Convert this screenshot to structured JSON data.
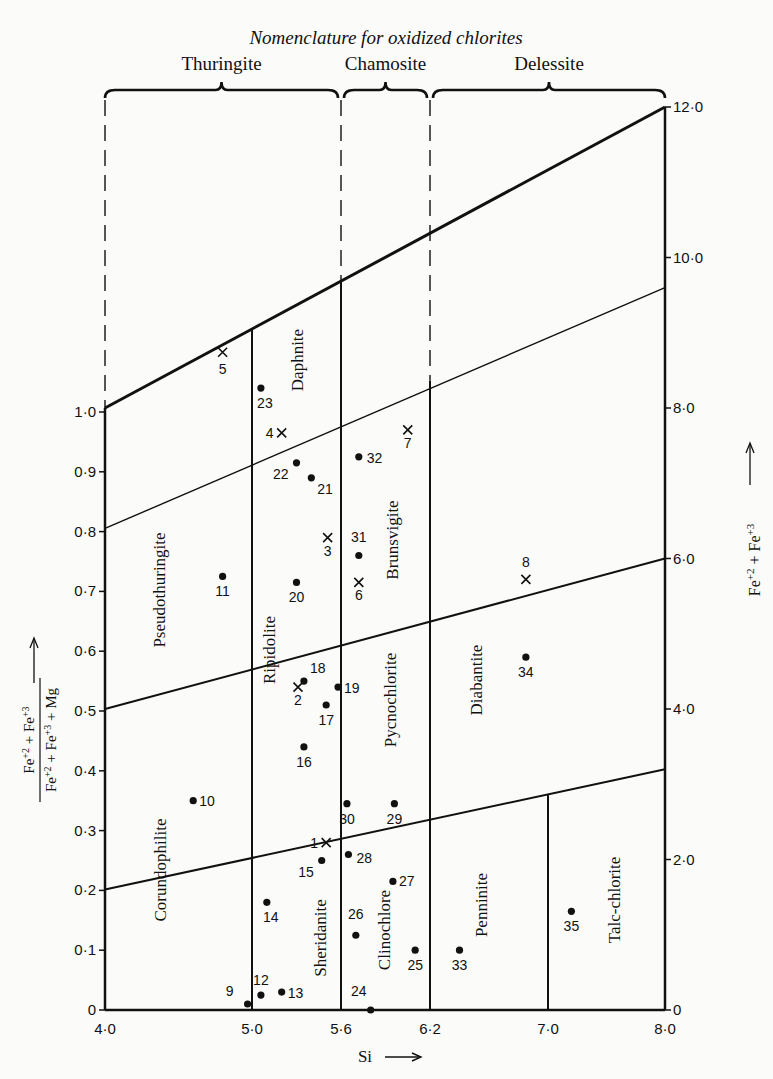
{
  "chart_data": {
    "type": "scatter",
    "title": "Nomenclature for oxidized chlorites",
    "xlabel": "Si",
    "ylabel_left": "(Fe+2 + Fe+3) / (Fe+2 + Fe+3 + Mg)",
    "ylabel_right": "Fe+2 + Fe+3",
    "x_ticks": [
      4.0,
      5.0,
      5.6,
      6.2,
      7.0,
      8.0
    ],
    "x_tick_labels": [
      "4·0",
      "5·0",
      "5·6",
      "6·2",
      "7·0",
      "8·0"
    ],
    "y_left_ticks": [
      0,
      0.1,
      0.2,
      0.3,
      0.4,
      0.5,
      0.6,
      0.7,
      0.8,
      0.9,
      1.0
    ],
    "y_left_tick_labels": [
      "0",
      "0·1",
      "0·2",
      "0·3",
      "0·4",
      "0·5",
      "0·6",
      "0·7",
      "0·8",
      "0·9",
      "1·0"
    ],
    "y_right_ticks": [
      0,
      2,
      4,
      6,
      8,
      10,
      12
    ],
    "y_right_tick_labels": [
      "0",
      "2·0",
      "4·0",
      "6·0",
      "8·0",
      "10·0",
      "12·0"
    ],
    "xlim": [
      4.0,
      8.0
    ],
    "ylim_left": [
      0,
      1.0
    ],
    "ylim_right": [
      0,
      12.0
    ],
    "groups": [
      {
        "name": "Thuringite",
        "x_range": [
          4.0,
          5.6
        ]
      },
      {
        "name": "Chamosite",
        "x_range": [
          5.6,
          6.2
        ]
      },
      {
        "name": "Delessite",
        "x_range": [
          6.2,
          8.0
        ]
      }
    ],
    "boundary_lines_right_axis": [
      {
        "name": "top",
        "from": [
          4.0,
          8.0
        ],
        "to": [
          8.0,
          12.0
        ],
        "weight": "heavy"
      },
      {
        "name": "upper",
        "from": [
          4.0,
          6.4
        ],
        "to": [
          8.0,
          9.6
        ],
        "weight": "light"
      },
      {
        "name": "middle",
        "from": [
          4.0,
          4.0
        ],
        "to": [
          8.0,
          6.0
        ],
        "weight": "mixed"
      },
      {
        "name": "lower",
        "from": [
          4.0,
          1.6
        ],
        "to": [
          8.0,
          3.2
        ],
        "weight": "mixed"
      }
    ],
    "regions": [
      {
        "name": "Pseudothuringite"
      },
      {
        "name": "Corundophilite"
      },
      {
        "name": "Daphnite"
      },
      {
        "name": "Ripidolite"
      },
      {
        "name": "Sheridanite"
      },
      {
        "name": "Brunsvigite"
      },
      {
        "name": "Pycnochlorite"
      },
      {
        "name": "Clinochlore"
      },
      {
        "name": "Diabantite"
      },
      {
        "name": "Penninite"
      },
      {
        "name": "Talc-chlorite"
      }
    ],
    "series": [
      {
        "name": "dot",
        "marker": "circle",
        "points": [
          {
            "id": "9",
            "x": 4.97,
            "y": 0.01
          },
          {
            "id": "10",
            "x": 4.6,
            "y": 0.35
          },
          {
            "id": "11",
            "x": 4.8,
            "y": 0.725
          },
          {
            "id": "12",
            "x": 5.06,
            "y": 0.025
          },
          {
            "id": "13",
            "x": 5.2,
            "y": 0.03
          },
          {
            "id": "14",
            "x": 5.1,
            "y": 0.18
          },
          {
            "id": "15",
            "x": 5.47,
            "y": 0.25
          },
          {
            "id": "16",
            "x": 5.35,
            "y": 0.44
          },
          {
            "id": "17",
            "x": 5.5,
            "y": 0.51
          },
          {
            "id": "18",
            "x": 5.35,
            "y": 0.55
          },
          {
            "id": "19",
            "x": 5.58,
            "y": 0.54
          },
          {
            "id": "20",
            "x": 5.3,
            "y": 0.715
          },
          {
            "id": "21",
            "x": 5.4,
            "y": 0.89
          },
          {
            "id": "22",
            "x": 5.3,
            "y": 0.915
          },
          {
            "id": "23",
            "x": 5.06,
            "y": 1.04
          },
          {
            "id": "24",
            "x": 5.8,
            "y": 0.0
          },
          {
            "id": "25",
            "x": 6.1,
            "y": 0.1
          },
          {
            "id": "26",
            "x": 5.7,
            "y": 0.125
          },
          {
            "id": "27",
            "x": 5.95,
            "y": 0.215
          },
          {
            "id": "28",
            "x": 5.65,
            "y": 0.26
          },
          {
            "id": "29",
            "x": 5.96,
            "y": 0.345
          },
          {
            "id": "30",
            "x": 5.64,
            "y": 0.345
          },
          {
            "id": "31",
            "x": 5.72,
            "y": 0.76
          },
          {
            "id": "32",
            "x": 5.72,
            "y": 0.925
          },
          {
            "id": "33",
            "x": 6.4,
            "y": 0.1
          },
          {
            "id": "34",
            "x": 6.85,
            "y": 0.59
          },
          {
            "id": "35",
            "x": 7.2,
            "y": 0.165
          }
        ]
      },
      {
        "name": "cross",
        "marker": "x",
        "points": [
          {
            "id": "1",
            "x": 5.5,
            "y": 0.28
          },
          {
            "id": "2",
            "x": 5.31,
            "y": 0.54
          },
          {
            "id": "3",
            "x": 5.51,
            "y": 0.79
          },
          {
            "id": "4",
            "x": 5.2,
            "y": 0.965
          },
          {
            "id": "5",
            "x": 4.8,
            "y": 1.1
          },
          {
            "id": "6",
            "x": 5.72,
            "y": 0.715
          },
          {
            "id": "7",
            "x": 6.05,
            "y": 0.97
          },
          {
            "id": "8",
            "x": 6.85,
            "y": 0.72
          }
        ]
      }
    ],
    "legend": null,
    "grid": false
  }
}
